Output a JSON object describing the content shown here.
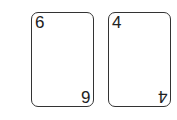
{
  "cards": [
    {
      "rank": "6"
    },
    {
      "rank": "4"
    }
  ]
}
